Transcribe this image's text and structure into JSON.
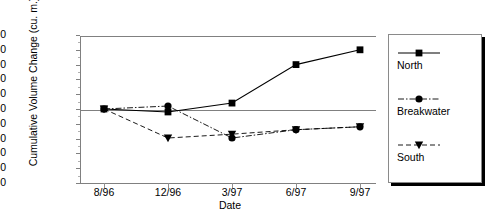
{
  "chart_data": {
    "type": "line",
    "title": "",
    "xlabel": "Date",
    "ylabel": "Cumulative Volume Change (cu. m.)",
    "categories": [
      "8/96",
      "12/96",
      "3/97",
      "6/97",
      "9/97"
    ],
    "ylim": [
      -25000,
      25000
    ],
    "ytick_step": 5000,
    "yticks": [
      "25000",
      "20000",
      "15000",
      "10000",
      "5000",
      "0",
      "-5000",
      "-10000",
      "-15000",
      "-20000",
      "-25000"
    ],
    "ytick_values": [
      25000,
      20000,
      15000,
      10000,
      5000,
      0,
      -5000,
      -10000,
      -15000,
      -20000,
      -25000
    ],
    "grid": false,
    "zero_line": true,
    "legend_position": "right",
    "series": [
      {
        "name": "North",
        "marker": "square",
        "linestyle": "solid",
        "color": "#000000",
        "values": [
          0,
          -1000,
          2000,
          15000,
          20000
        ]
      },
      {
        "name": "Breakwater",
        "marker": "circle",
        "linestyle": "dashdot",
        "color": "#000000",
        "values": [
          0,
          1000,
          -9800,
          -7000,
          -6000
        ]
      },
      {
        "name": "South",
        "marker": "triangle-down",
        "linestyle": "dashed",
        "color": "#000000",
        "values": [
          0,
          -9800,
          -8500,
          -7000,
          -6000
        ]
      }
    ]
  },
  "legend": {
    "entries": [
      {
        "label": "North"
      },
      {
        "label": "Breakwater"
      },
      {
        "label": "South"
      }
    ]
  }
}
